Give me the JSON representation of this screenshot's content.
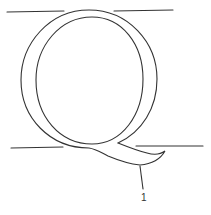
{
  "diagram": {
    "glyph": "Q",
    "stroke_color": "#333333",
    "guide_lines": [
      {
        "name": "top-left-guide",
        "x1": 7,
        "y1": 12,
        "x2": 64,
        "y2": 11
      },
      {
        "name": "top-right-guide",
        "x1": 114,
        "y1": 11,
        "x2": 173,
        "y2": 10
      },
      {
        "name": "baseline-left-guide",
        "x1": 11,
        "y1": 148,
        "x2": 63,
        "y2": 147
      },
      {
        "name": "baseline-right-guide",
        "x1": 136,
        "y1": 146,
        "x2": 203,
        "y2": 146
      }
    ],
    "callouts": [
      {
        "label": "1",
        "target": "tail",
        "x": 141,
        "y": 193
      }
    ]
  }
}
